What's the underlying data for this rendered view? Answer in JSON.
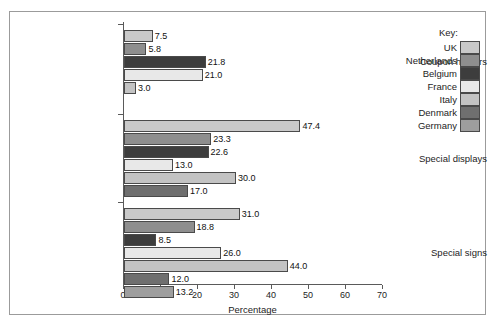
{
  "figure": {
    "caption_fragment": "",
    "x_axis_title": "Percentage",
    "legend_title": "Key:"
  },
  "legend": {
    "entries": [
      {
        "label": "UK",
        "color": "#c9c9c9"
      },
      {
        "label": "Netherlands",
        "color": "#8e8e8e"
      },
      {
        "label": "Belgium",
        "color": "#3d3d3d"
      },
      {
        "label": "France",
        "color": "#e8e8e8"
      },
      {
        "label": "Italy",
        "color": "#c3c3c3"
      },
      {
        "label": "Denmark",
        "color": "#6f6f6f"
      },
      {
        "label": "Germany",
        "color": "#9e9e9e"
      }
    ]
  },
  "chart_data": {
    "type": "bar",
    "orientation": "horizontal",
    "title": "",
    "xlabel": "Percentage",
    "ylabel": "",
    "xlim": [
      0,
      70
    ],
    "xticks": [
      0,
      10,
      20,
      30,
      40,
      50,
      60,
      70
    ],
    "grid": false,
    "legend_position": "right",
    "categories": [
      "Coupon holders",
      "Special displays",
      "Special signs"
    ],
    "series": [
      {
        "name": "UK",
        "values": [
          7.5,
          47.4,
          31.0
        ]
      },
      {
        "name": "Netherlands",
        "values": [
          5.8,
          23.3,
          18.8
        ]
      },
      {
        "name": "Belgium",
        "values": [
          21.8,
          22.6,
          8.5
        ]
      },
      {
        "name": "France",
        "values": [
          21.0,
          13.0,
          26.0
        ]
      },
      {
        "name": "Italy",
        "values": [
          3.0,
          30.0,
          44.0
        ]
      },
      {
        "name": "Denmark",
        "values": [
          null,
          17.0,
          12.0
        ]
      },
      {
        "name": "Germany",
        "values": [
          null,
          null,
          13.2
        ]
      }
    ],
    "groups": [
      {
        "category": "Coupon holders",
        "bars": [
          {
            "series": "UK",
            "value": 7.5,
            "label": "7.5"
          },
          {
            "series": "Netherlands",
            "value": 5.8,
            "label": "5.8"
          },
          {
            "series": "Belgium",
            "value": 21.8,
            "label": "21.8"
          },
          {
            "series": "France",
            "value": 21.0,
            "label": "21.0"
          },
          {
            "series": "Italy",
            "value": 3.0,
            "label": "3.0"
          }
        ]
      },
      {
        "category": "Special displays",
        "bars": [
          {
            "series": "UK",
            "value": 47.4,
            "label": "47.4"
          },
          {
            "series": "Netherlands",
            "value": 23.3,
            "label": "23.3"
          },
          {
            "series": "Belgium",
            "value": 22.6,
            "label": "22.6"
          },
          {
            "series": "France",
            "value": 13.0,
            "label": "13.0"
          },
          {
            "series": "Italy",
            "value": 30.0,
            "label": "30.0"
          },
          {
            "series": "Denmark",
            "value": 17.0,
            "label": "17.0"
          }
        ]
      },
      {
        "category": "Special signs",
        "bars": [
          {
            "series": "UK",
            "value": 31.0,
            "label": "31.0"
          },
          {
            "series": "Netherlands",
            "value": 18.8,
            "label": "18.8"
          },
          {
            "series": "Belgium",
            "value": 8.5,
            "label": "8.5"
          },
          {
            "series": "France",
            "value": 26.0,
            "label": "26.0"
          },
          {
            "series": "Italy",
            "value": 44.0,
            "label": "44.0"
          },
          {
            "series": "Denmark",
            "value": 12.0,
            "label": "12.0"
          },
          {
            "series": "Germany",
            "value": 13.2,
            "label": "13.2"
          }
        ]
      }
    ]
  }
}
